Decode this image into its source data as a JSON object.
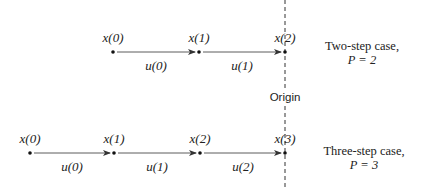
{
  "diagram": {
    "origin_label": "Origin",
    "origin_x": 285,
    "rows": [
      {
        "id": "two-step",
        "y": 52,
        "caption_line1": "Two-step case,",
        "caption_line2": "P = 2",
        "nodes": [
          {
            "label": "x(0)",
            "x": 113
          },
          {
            "label": "x(1)",
            "x": 199
          },
          {
            "label": "x(2)",
            "x": 285
          }
        ],
        "edges": [
          {
            "label": "u(0)"
          },
          {
            "label": "u(1)"
          }
        ]
      },
      {
        "id": "three-step",
        "y": 153,
        "caption_line1": "Three-step case,",
        "caption_line2": "P = 3",
        "nodes": [
          {
            "label": "x(0)",
            "x": 30
          },
          {
            "label": "x(1)",
            "x": 114
          },
          {
            "label": "x(2)",
            "x": 200
          },
          {
            "label": "x(3)",
            "x": 285
          }
        ],
        "edges": [
          {
            "label": "u(0)"
          },
          {
            "label": "u(1)"
          },
          {
            "label": "u(2)"
          }
        ]
      }
    ]
  }
}
